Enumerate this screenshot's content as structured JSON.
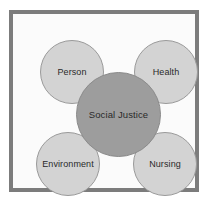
{
  "diagram": {
    "type": "hub-and-spoke",
    "center": {
      "id": "social-justice",
      "label": "Social Justice",
      "fill": "#9d9d9d",
      "stroke": "#8a8a8a"
    },
    "satellites": [
      {
        "id": "person",
        "label": "Person",
        "position": "top-left",
        "fill": "#d3d3d3",
        "stroke": "#9a9a9a"
      },
      {
        "id": "health",
        "label": "Health",
        "position": "top-right",
        "fill": "#d3d3d3",
        "stroke": "#9a9a9a"
      },
      {
        "id": "environment",
        "label": "Environment",
        "position": "bottom-left",
        "fill": "#d3d3d3",
        "stroke": "#9a9a9a"
      },
      {
        "id": "nursing",
        "label": "Nursing",
        "position": "bottom-right",
        "fill": "#d3d3d3",
        "stroke": "#9a9a9a"
      }
    ],
    "frame": {
      "border_color": "#7c7c7c",
      "background": "#fbfbfb"
    },
    "page_background": "#ffffff"
  }
}
